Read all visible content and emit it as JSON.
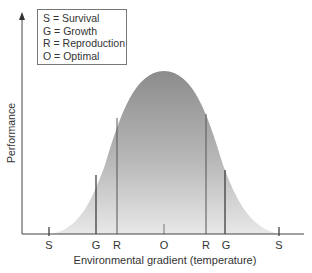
{
  "legend": {
    "items": [
      {
        "key": "S",
        "label": "S = Survival"
      },
      {
        "key": "G",
        "label": "G = Growth"
      },
      {
        "key": "R",
        "label": "R = Reproduction"
      },
      {
        "key": "O",
        "label": "O = Optimal"
      }
    ]
  },
  "axes": {
    "x_title": "Environmental gradient (temperature)",
    "y_title": "Performance"
  },
  "ticks": [
    {
      "label": "S",
      "x": 49
    },
    {
      "label": "G",
      "x": 96
    },
    {
      "label": "R",
      "x": 117
    },
    {
      "label": "O",
      "x": 164
    },
    {
      "label": "R",
      "x": 206
    },
    {
      "label": "G",
      "x": 225
    },
    {
      "label": "S",
      "x": 279
    }
  ],
  "colors": {
    "curve_top": "#8c8c8c",
    "curve_bottom": "#e6e6e6",
    "axis": "#444444",
    "lines": "#333333"
  }
}
